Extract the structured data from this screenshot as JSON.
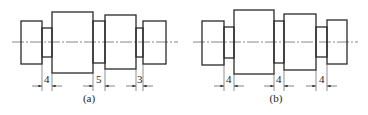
{
  "figures": [
    {
      "id": "a",
      "caption": "(a)",
      "offset_x": 0,
      "dimensions": [
        {
          "label": "4",
          "x1": 42,
          "x2": 52
        },
        {
          "label": "5",
          "x1": 93,
          "x2": 105
        },
        {
          "label": "3",
          "x1": 136,
          "x2": 143
        }
      ]
    },
    {
      "id": "b",
      "caption": "(b)",
      "offset_x": 181,
      "dimensions": [
        {
          "label": "4",
          "x1": 224,
          "x2": 234
        },
        {
          "label": "4",
          "x1": 274,
          "x2": 284
        },
        {
          "label": "4",
          "x1": 316,
          "x2": 327
        }
      ]
    }
  ]
}
